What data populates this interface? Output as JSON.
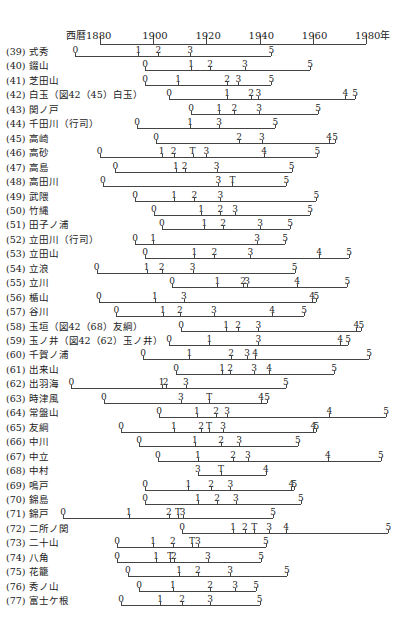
{
  "chart_data": {
    "type": "timeline",
    "title": "",
    "axis": {
      "prefix": "西暦",
      "suffix": "年",
      "ticks": [
        1880,
        1900,
        1920,
        1940,
        1960,
        1980
      ],
      "range": [
        1880,
        1980
      ]
    },
    "rows": [
      {
        "label": "(39) 式秀",
        "markers": [
          [
            "0",
            1870.7
          ],
          [
            "1",
            1894.4
          ],
          [
            "2",
            1901.9
          ],
          [
            "3",
            1913.9
          ],
          [
            "5",
            1944.4
          ]
        ]
      },
      {
        "label": "(40) 錣山",
        "markers": [
          [
            "0",
            1897.0
          ],
          [
            "1",
            1914.3
          ],
          [
            "2",
            1921.4
          ],
          [
            "3",
            1934.5
          ],
          [
            "5",
            1959.0
          ]
        ]
      },
      {
        "label": "(41) 芝田山",
        "markers": [
          [
            "0",
            1897.0
          ],
          [
            "1",
            1909.4
          ],
          [
            "2",
            1927.8
          ],
          [
            "3",
            1932.0
          ],
          [
            "5",
            1944.4
          ]
        ]
      },
      {
        "label": "(42) 白玉（図42（45）白玉）",
        "markers": [
          [
            "0",
            1906.0
          ],
          [
            "1",
            1927.8
          ],
          [
            "2",
            1936.8
          ],
          [
            "3",
            1939.5
          ],
          [
            "4",
            1972.2
          ],
          [
            "5",
            1975.9
          ]
        ]
      },
      {
        "label": "(43) 関ノ戸",
        "markers": [
          [
            "0",
            1914.3
          ],
          [
            "1",
            1924.8
          ],
          [
            "2",
            1930.5
          ],
          [
            "3",
            1939.8
          ],
          [
            "5",
            1962.0
          ]
        ]
      },
      {
        "label": "(44) 千田川（行司）",
        "markers": [
          [
            "0",
            1894.0
          ],
          [
            "1",
            1913.9
          ],
          [
            "3",
            1924.8
          ],
          [
            "5",
            1945.9
          ]
        ]
      },
      {
        "label": "(45) 高崎",
        "markers": [
          [
            "0",
            1901.1
          ],
          [
            "2",
            1932.3
          ],
          [
            "3",
            1940.9
          ],
          [
            "4",
            1966.1
          ],
          [
            "5",
            1968.4
          ]
        ]
      },
      {
        "label": "(46) 高砂",
        "markers": [
          [
            "0",
            1879.9
          ],
          [
            "1",
            1903.2
          ],
          [
            "2",
            1907.7
          ],
          [
            "T",
            1914.8
          ],
          [
            "3",
            1920.0
          ],
          [
            "4",
            1941.7
          ],
          [
            "5",
            1961.7
          ]
        ]
      },
      {
        "label": "(47) 高島",
        "markers": [
          [
            "0",
            1885.8
          ],
          [
            "1",
            1908.5
          ],
          [
            "2",
            1911.8
          ],
          [
            "3",
            1923.8
          ],
          [
            "5",
            1952.0
          ]
        ]
      },
      {
        "label": "(48) 高田川",
        "markers": [
          [
            "0",
            1881.1
          ],
          [
            "3",
            1924.5
          ],
          [
            "T",
            1929.8
          ],
          [
            "5",
            1950.1
          ]
        ]
      },
      {
        "label": "(49) 武隈",
        "markers": [
          [
            "0",
            1893.2
          ],
          [
            "1",
            1907.9
          ],
          [
            "2",
            1915.5
          ],
          [
            "3",
            1925.3
          ],
          [
            "5",
            1961.3
          ]
        ]
      },
      {
        "label": "(50) 竹縄",
        "markers": [
          [
            "0",
            1900.3
          ],
          [
            "1",
            1918.0
          ],
          [
            "2",
            1925.3
          ],
          [
            "3",
            1930.8
          ],
          [
            "5",
            1959.0
          ]
        ]
      },
      {
        "label": "(51) 田子ノ浦",
        "markers": [
          [
            "0",
            1903.3
          ],
          [
            "1",
            1919.2
          ],
          [
            "2",
            1926.3
          ],
          [
            "3",
            1940.2
          ],
          [
            "5",
            1951.5
          ]
        ]
      },
      {
        "label": "(52) 立田川（行司）",
        "markers": [
          [
            "0",
            1893.2
          ],
          [
            "1",
            1900.0
          ],
          [
            "3",
            1939.1
          ],
          [
            "5",
            1949.6
          ]
        ]
      },
      {
        "label": "(53) 立田山",
        "markers": [
          [
            "0",
            1897.0
          ],
          [
            "1",
            1915.5
          ],
          [
            "2",
            1923.0
          ],
          [
            "3",
            1936.5
          ],
          [
            "4",
            1962.4
          ],
          [
            "5",
            1973.7
          ]
        ]
      },
      {
        "label": "(54) 立浪",
        "markers": [
          [
            "0",
            1878.7
          ],
          [
            "1",
            1897.5
          ],
          [
            "2",
            1903.2
          ],
          [
            "3",
            1914.8
          ],
          [
            "5",
            1953.2
          ]
        ]
      },
      {
        "label": "(55) 立川",
        "markers": [
          [
            "0",
            1907.1
          ],
          [
            "1",
            1924.1
          ],
          [
            "2",
            1933.8
          ],
          [
            "3",
            1935.3
          ],
          [
            "4",
            1954.1
          ],
          [
            "5",
            1973.0
          ]
        ]
      },
      {
        "label": "(56) 楯山",
        "markers": [
          [
            "0",
            1879.6
          ],
          [
            "1",
            1900.6
          ],
          [
            "3",
            1911.5
          ],
          [
            "4",
            1959.7
          ],
          [
            "5",
            1961.3
          ]
        ]
      },
      {
        "label": "(57) 谷川",
        "markers": [
          [
            "0",
            1886.2
          ],
          [
            "1",
            1903.6
          ],
          [
            "2",
            1910.0
          ],
          [
            "3",
            1922.8
          ],
          [
            "4",
            1944.7
          ],
          [
            "5",
            1956.7
          ]
        ]
      },
      {
        "label": "(58) 玉垣（図42（68）友綱）",
        "markers": [
          [
            "0",
            1910.5
          ],
          [
            "1",
            1927.4
          ],
          [
            "2",
            1931.9
          ],
          [
            "3",
            1939.5
          ],
          [
            "4",
            1976.4
          ],
          [
            "5",
            1978.3
          ]
        ]
      },
      {
        "label": "(59) 玉ノ井（図42（62）玉ノ井）",
        "markers": [
          [
            "0",
            1906.0
          ],
          [
            "1",
            1921.1
          ],
          [
            "3",
            1939.5
          ],
          [
            "4",
            1970.3
          ],
          [
            "5",
            1973.3
          ]
        ]
      },
      {
        "label": "(60) 千賀ノ浦",
        "markers": [
          [
            "0",
            1896.2
          ],
          [
            "1",
            1913.6
          ],
          [
            "2",
            1929.3
          ],
          [
            "3",
            1935.3
          ],
          [
            "4",
            1938.3
          ],
          [
            "5",
            1981.2
          ]
        ]
      },
      {
        "label": "(61) 出来山",
        "markers": [
          [
            "0",
            1908.6
          ],
          [
            "1",
            1925.9
          ],
          [
            "2",
            1928.9
          ],
          [
            "3",
            1937.9
          ],
          [
            "4",
            1943.6
          ],
          [
            "5",
            1968.0
          ]
        ]
      },
      {
        "label": "(62) 出羽海",
        "markers": [
          [
            "0",
            1869.2
          ],
          [
            "1",
            1903.2
          ],
          [
            "2",
            1904.7
          ],
          [
            "3",
            1912.3
          ],
          [
            "5",
            1949.9
          ]
        ]
      },
      {
        "label": "(63) 時津風",
        "markers": [
          [
            "0",
            1881.5
          ],
          [
            "3",
            1910.4
          ],
          [
            "T",
            1921.1
          ],
          [
            "4",
            1940.6
          ],
          [
            "5",
            1942.8
          ]
        ]
      },
      {
        "label": "(64) 常盤山",
        "markers": [
          [
            "0",
            1902.2
          ],
          [
            "1",
            1916.4
          ],
          [
            "2",
            1923.7
          ],
          [
            "3",
            1927.8
          ],
          [
            "4",
            1966.2
          ],
          [
            "5",
            1987.6
          ]
        ]
      },
      {
        "label": "(65) 友綱",
        "markers": [
          [
            "0",
            1887.9
          ],
          [
            "1",
            1907.8
          ],
          [
            "2",
            1918.0
          ],
          [
            "T",
            1921.0
          ],
          [
            "3",
            1926.3
          ],
          [
            "4",
            1960.2
          ],
          [
            "5",
            1961.3
          ]
        ]
      },
      {
        "label": "(66) 中川",
        "markers": [
          [
            "0",
            1894.7
          ],
          [
            "1",
            1915.7
          ],
          [
            "2",
            1925.5
          ],
          [
            "3",
            1932.3
          ],
          [
            "5",
            1954.4
          ]
        ]
      },
      {
        "label": "(67) 中立",
        "markers": [
          [
            "0",
            1901.8
          ],
          [
            "1",
            1916.8
          ],
          [
            "2",
            1930.0
          ],
          [
            "3",
            1935.6
          ],
          [
            "4",
            1965.7
          ],
          [
            "5",
            1985.6
          ]
        ]
      },
      {
        "label": "(68) 中村",
        "markers": [
          [
            "3",
            1916.8
          ],
          [
            "T",
            1925.5
          ],
          [
            "4",
            1942.4
          ]
        ]
      },
      {
        "label": "(69) 鳴戸",
        "markers": [
          [
            "0",
            1897.0
          ],
          [
            "1",
            1913.2
          ],
          [
            "2",
            1921.8
          ],
          [
            "3",
            1929.0
          ],
          [
            "4",
            1951.9
          ],
          [
            "5",
            1953.1
          ]
        ]
      },
      {
        "label": "(70) 錦島",
        "markers": [
          [
            "0",
            1897.0
          ],
          [
            "1",
            1916.8
          ],
          [
            "2",
            1924.0
          ],
          [
            "3",
            1931.1
          ],
          [
            "5",
            1955.5
          ]
        ]
      },
      {
        "label": "(71) 錦戸",
        "markers": [
          [
            "0",
            1866.1
          ],
          [
            "1",
            1890.9
          ],
          [
            "2",
            1905.9
          ],
          [
            "T",
            1909.3
          ],
          [
            "3",
            1911.1
          ],
          [
            "5",
            1945.1
          ]
        ]
      },
      {
        "label": "(72) 二所ノ関",
        "markers": [
          [
            "0",
            1910.9
          ],
          [
            "1",
            1930.0
          ],
          [
            "2",
            1934.5
          ],
          [
            "T",
            1938.0
          ],
          [
            "3",
            1943.6
          ],
          [
            "4",
            1950.0
          ],
          [
            "5",
            1988.4
          ]
        ]
      },
      {
        "label": "(73) 二十山",
        "markers": [
          [
            "0",
            1886.4
          ],
          [
            "1",
            1900.0
          ],
          [
            "2",
            1907.4
          ],
          [
            "T",
            1914.6
          ],
          [
            "3",
            1916.8
          ],
          [
            "5",
            1942.4
          ]
        ]
      },
      {
        "label": "(74) 八角",
        "markers": [
          [
            "0",
            1886.4
          ],
          [
            "1",
            1901.1
          ],
          [
            "T",
            1906.4
          ],
          [
            "2",
            1907.8
          ],
          [
            "3",
            1920.6
          ],
          [
            "5",
            1940.6
          ]
        ]
      },
      {
        "label": "(75) 花籠",
        "markers": [
          [
            "0",
            1890.5
          ],
          [
            "1",
            1909.7
          ],
          [
            "2",
            1916.8
          ],
          [
            "3",
            1928.9
          ],
          [
            "5",
            1950.3
          ]
        ]
      },
      {
        "label": "(76) 秀ノ山",
        "markers": [
          [
            "0",
            1894.7
          ],
          [
            "1",
            1907.4
          ],
          [
            "2",
            1921.4
          ],
          [
            "3",
            1930.8
          ],
          [
            "5",
            1938.7
          ]
        ]
      },
      {
        "label": "(77) 富士ケ根",
        "markers": [
          [
            "0",
            1887.9
          ],
          [
            "1",
            1902.6
          ],
          [
            "2",
            1910.9
          ],
          [
            "3",
            1921.4
          ],
          [
            "5",
            1940.0
          ]
        ]
      }
    ],
    "legend": {
      "T": "marker T",
      "digits": "stage numbers 0–5"
    }
  }
}
